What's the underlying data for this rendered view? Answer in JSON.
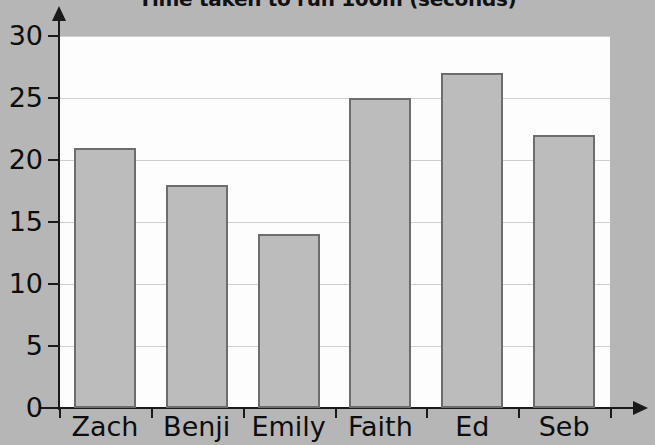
{
  "chart_data": {
    "type": "bar",
    "title": "Time taken to run 100m (seconds)",
    "xlabel": "",
    "ylabel": "",
    "categories": [
      "Zach",
      "Benji",
      "Emily",
      "Faith",
      "Ed",
      "Seb"
    ],
    "values": [
      21,
      18,
      14,
      25,
      27,
      22
    ],
    "ylim": [
      0,
      30
    ],
    "ytick_labels": [
      "0",
      "5",
      "10",
      "15",
      "20",
      "25",
      "30"
    ],
    "ytick_values": [
      0,
      5,
      10,
      15,
      20,
      25,
      30
    ],
    "grid": true,
    "legend": false,
    "legend_position": "none",
    "series": [
      {
        "name": "Time (seconds)",
        "values": [
          21,
          18,
          14,
          25,
          27,
          22
        ]
      }
    ],
    "annotations": [],
    "colors": {
      "bar_fill": "#bcbcbc",
      "bar_border": "#6d6d6d",
      "plot_background": "#fdfdfd",
      "page_background": "#b6b6b6",
      "axis": "#1a1a1a",
      "gridline": "#cfcfcf",
      "text": "#0d0d0d"
    }
  }
}
